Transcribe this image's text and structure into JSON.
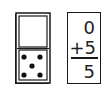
{
  "domino": {
    "top_half_pips": 0,
    "bottom_half_pips": 5
  },
  "addition_card": {
    "addend_1": "0",
    "addend_2": "+5",
    "sum": "5"
  },
  "colors": {
    "ink": "#1a1a1a",
    "background": "#ffffff"
  }
}
